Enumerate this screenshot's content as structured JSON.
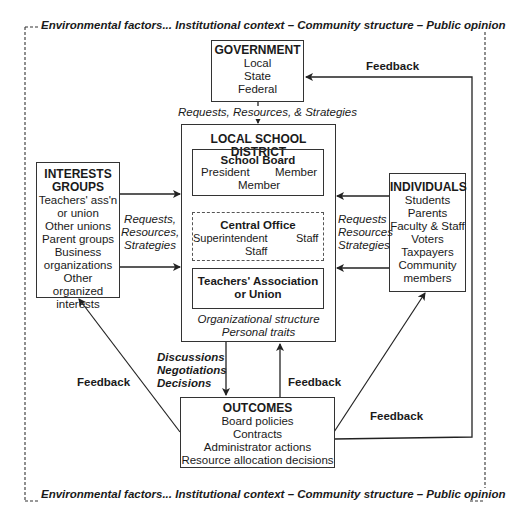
{
  "environment": {
    "top_label": "Environmental factors... Institutional context – Community structure – Public opinion",
    "bottom_label": "Environmental factors... Institutional context – Community structure – Public opinion"
  },
  "government": {
    "title": "GOVERNMENT",
    "items": [
      "Local",
      "State",
      "Federal"
    ]
  },
  "government_link_label": "Requests, Resources, & Strategies",
  "district": {
    "title": "LOCAL SCHOOL DISTRICT",
    "school_board": {
      "title": "School Board",
      "president": "President",
      "member_right": "Member",
      "member_bottom": "Member"
    },
    "central_office": {
      "title": "Central Office",
      "superintendent": "Superintendent",
      "staff_right": "Staff",
      "staff_bottom": "Staff"
    },
    "teachers": {
      "line1": "Teachers' Association",
      "line2": "or Union"
    },
    "footer": [
      "Organizational structure",
      "Personal traits"
    ]
  },
  "interest_groups": {
    "title_line1": "INTERESTS",
    "title_line2": "GROUPS",
    "items": [
      "Teachers' ass'n",
      "or union",
      "Other unions",
      "Parent groups",
      "Business",
      "organizations",
      "Other organized",
      "interests"
    ]
  },
  "interest_link_label": [
    "Requests,",
    "Resources,",
    "Strategies"
  ],
  "individuals": {
    "title": "INDIVIDUALS",
    "items": [
      "Students",
      "Parents",
      "Faculty & Staff",
      "Voters",
      "Taxpayers",
      "Community",
      "members"
    ]
  },
  "individuals_link_label": [
    "Requests",
    "Resources",
    "Strategies"
  ],
  "decision_label": [
    "Discussions",
    "Negotiations",
    "Decisions"
  ],
  "outcomes": {
    "title": "OUTCOMES",
    "items": [
      "Board policies",
      "Contracts",
      "Administrator actions",
      "Resource allocation decisions"
    ]
  },
  "feedback_labels": {
    "top_right": "Feedback",
    "left": "Feedback",
    "center": "Feedback",
    "bottom_right": "Feedback"
  }
}
